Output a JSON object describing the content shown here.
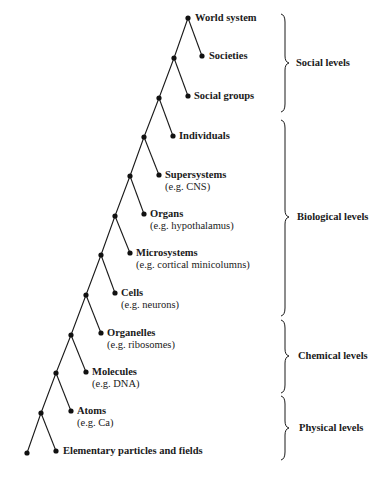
{
  "diagram": {
    "type": "hierarchical-levels-tree",
    "levels": [
      {
        "name": "World system",
        "example": ""
      },
      {
        "name": "Societies",
        "example": ""
      },
      {
        "name": "Social groups",
        "example": ""
      },
      {
        "name": "Individuals",
        "example": ""
      },
      {
        "name": "Supersystems",
        "example": "(e.g. CNS)"
      },
      {
        "name": "Organs",
        "example": "(e.g. hypothalamus)"
      },
      {
        "name": "Microsystems",
        "example": "(e.g. cortical minicolumns)"
      },
      {
        "name": "Cells",
        "example": "(e.g. neurons)"
      },
      {
        "name": "Organelles",
        "example": "(e.g. ribosomes)"
      },
      {
        "name": "Molecules",
        "example": "(e.g. DNA)"
      },
      {
        "name": "Atoms",
        "example": "(e.g. Ca)"
      },
      {
        "name": "Elementary particles and fields",
        "example": ""
      }
    ],
    "groups": [
      {
        "label": "Social levels",
        "members": [
          "World system",
          "Societies",
          "Social groups"
        ]
      },
      {
        "label": "Biological levels",
        "members": [
          "Individuals",
          "Supersystems",
          "Organs",
          "Microsystems",
          "Cells"
        ]
      },
      {
        "label": "Chemical levels",
        "members": [
          "Organelles",
          "Molecules"
        ]
      },
      {
        "label": "Physical levels",
        "members": [
          "Atoms",
          "Elementary particles and fields"
        ]
      }
    ],
    "colors": {
      "line": "#1a1a1a",
      "node": "#111111",
      "background": "#ffffff"
    }
  }
}
